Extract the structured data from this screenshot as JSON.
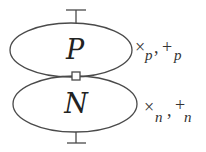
{
  "diagram": {
    "top_region": {
      "label": "P",
      "ops": {
        "times": "×",
        "sub1": "p",
        "comma": ",",
        "plus": "+",
        "sub2": "p"
      }
    },
    "bottom_region": {
      "label": "N",
      "ops": {
        "times": "×",
        "sub1": "n",
        "comma": ",",
        "plus": "+",
        "sub2": "n"
      }
    },
    "junction": "square-node",
    "terminals": [
      "top-terminal",
      "bottom-terminal"
    ],
    "colors": {
      "stroke": "#4a4a4a",
      "text": "#222222",
      "background": "#ffffff"
    }
  }
}
